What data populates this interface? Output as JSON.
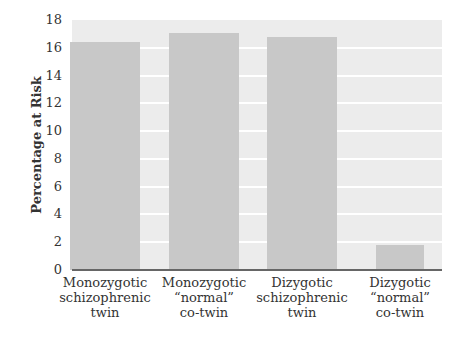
{
  "chart_data": {
    "type": "bar",
    "title": "",
    "xlabel": "",
    "ylabel": "Percentage at Risk",
    "ylim": [
      0,
      18
    ],
    "yticks": [
      0,
      2,
      4,
      6,
      8,
      10,
      12,
      14,
      16,
      18
    ],
    "grid": true,
    "categories": [
      "Monozygotic schizophrenic twin",
      "Monozygotic “normal” co-twin",
      "Dizygotic schizophrenic twin",
      "Dizygotic “normal” co-twin"
    ],
    "category_lines": [
      [
        "Monozygotic",
        "schizophrenic",
        "twin"
      ],
      [
        "Monozygotic",
        "“normal”",
        "co-twin"
      ],
      [
        "Dizygotic",
        "schizophrenic",
        "twin"
      ],
      [
        "Dizygotic",
        "“normal”",
        "co-twin"
      ]
    ],
    "values": [
      16.4,
      17.1,
      16.8,
      1.8
    ],
    "colors": {
      "bar": "#c8c8c8",
      "plot_bg": "#ececec",
      "grid": "#ffffff",
      "axis": "#666666"
    }
  }
}
